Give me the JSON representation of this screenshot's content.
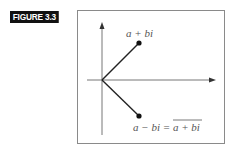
{
  "figure": {
    "label": "FIGURE 3.3"
  },
  "diagram": {
    "type": "complex-plane",
    "points": [
      {
        "name": "z",
        "label": "a + bi",
        "x": 139,
        "y": 43
      },
      {
        "name": "z-conjugate",
        "label_left": "a − bi = ",
        "label_right": "a + bi",
        "overline_right": true,
        "x": 139,
        "y": 116
      }
    ],
    "origin": {
      "x": 102,
      "y": 80
    },
    "colors": {
      "axis": "#777777",
      "line": "#222222",
      "point": "#111111",
      "text": "#555555",
      "frame": "#8a8a8a",
      "label_bg": "#111111",
      "label_fg": "#ffffff"
    }
  }
}
